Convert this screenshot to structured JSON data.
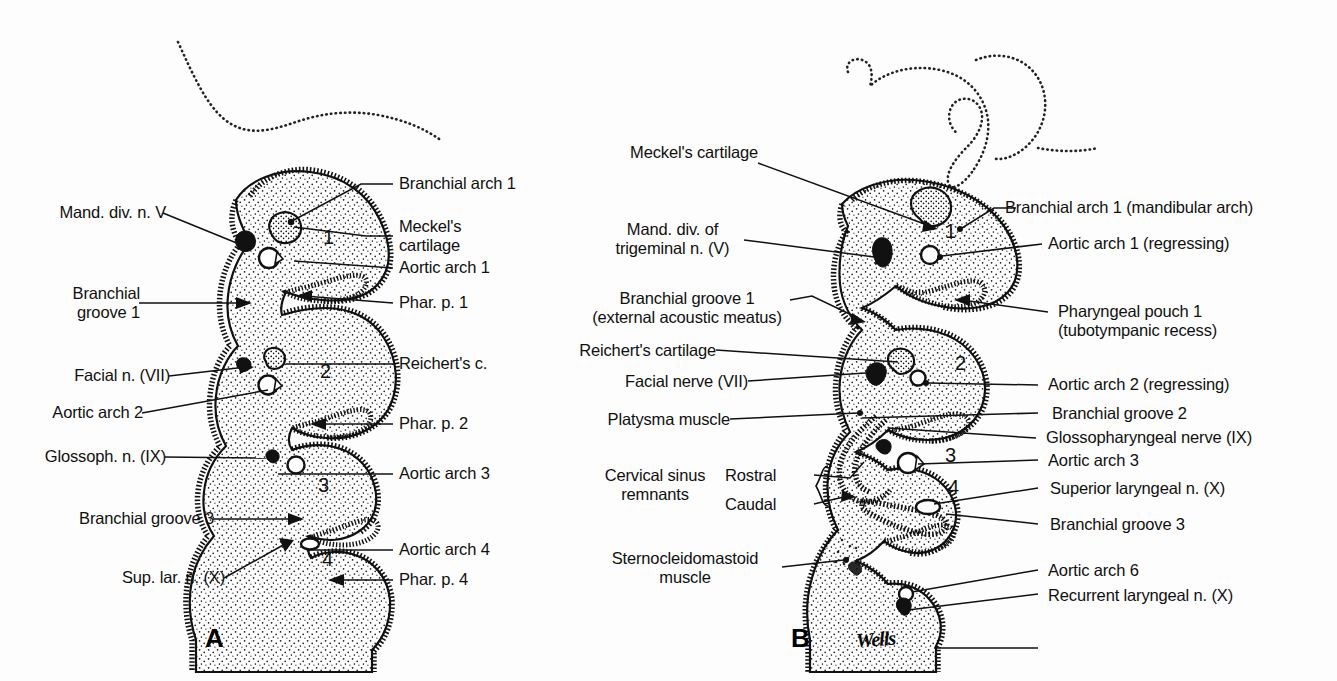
{
  "figure": {
    "panel_a": {
      "letter": "A",
      "arch_numbers": [
        "1",
        "2",
        "3",
        "4"
      ],
      "labels_left": [
        {
          "text": "Mand. div. n. V"
        },
        {
          "text": "Branchial\ngroove 1"
        },
        {
          "text": "Facial n. (VII)"
        },
        {
          "text": "Aortic arch 2"
        },
        {
          "text": "Glossoph. n. (IX)"
        },
        {
          "text": "Branchial groove 3"
        },
        {
          "text": "Sup. lar. n. (X)"
        }
      ],
      "labels_right": [
        {
          "text": "Branchial arch 1"
        },
        {
          "text": "Meckel's\ncartilage"
        },
        {
          "text": "Aortic arch 1"
        },
        {
          "text": "Phar. p. 1"
        },
        {
          "text": "Reichert's c."
        },
        {
          "text": "Phar. p. 2"
        },
        {
          "text": "Aortic arch 3"
        },
        {
          "text": "Aortic arch 4"
        },
        {
          "text": "Phar. p. 4"
        }
      ]
    },
    "panel_b": {
      "letter": "B",
      "signature": "Wells",
      "arch_numbers": [
        "1",
        "2",
        "3",
        "4"
      ],
      "labels_left": [
        {
          "text": "Meckel's cartilage"
        },
        {
          "text": "Mand. div. of\ntrigeminal n. (V)"
        },
        {
          "text": "Branchial groove 1\n(external acoustic meatus)"
        },
        {
          "text": "Reichert's cartilage"
        },
        {
          "text": "Facial nerve (VII)"
        },
        {
          "text": "Platysma muscle"
        },
        {
          "text": "Cervical sinus\nremnants"
        },
        {
          "text": "Rostral"
        },
        {
          "text": "Caudal"
        },
        {
          "text": "Sternocleidomastoid\nmuscle"
        }
      ],
      "labels_right": [
        {
          "text": "Branchial arch 1 (mandibular arch)"
        },
        {
          "text": "Aortic arch 1 (regressing)"
        },
        {
          "text": "Pharyngeal pouch 1\n(tubotympanic recess)"
        },
        {
          "text": "Aortic arch 2 (regressing)"
        },
        {
          "text": "Branchial groove 2"
        },
        {
          "text": "Glossopharyngeal nerve (IX)"
        },
        {
          "text": "Aortic arch 3"
        },
        {
          "text": "Superior laryngeal n. (X)"
        },
        {
          "text": "Branchial groove 3"
        },
        {
          "text": "Aortic arch 6"
        },
        {
          "text": "Recurrent laryngeal n. (X)"
        }
      ]
    },
    "colors": {
      "ink": "#111111",
      "paper": "#fdfdfd"
    }
  }
}
